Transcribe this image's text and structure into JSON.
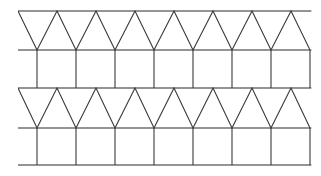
{
  "figure": {
    "background_color": "#ffffff",
    "line_color": "#2b2b2b",
    "zigzag_color": "#3a3a3a",
    "width": 321,
    "height": 176,
    "stroke_width": 1.1
  },
  "geometry": {
    "margin_left": 18,
    "margin_right": 311,
    "horizontal_lines_y": [
      11,
      50,
      88,
      128,
      165
    ],
    "band_count": 4,
    "bands": [
      {
        "index": 0,
        "type": "zigzag",
        "label": "triangle-band-top",
        "top_y": 11,
        "bottom_y": 50,
        "period": 39,
        "phase_offset": 0,
        "apex_count": 7,
        "apex_x": [
          57,
          96,
          135,
          174,
          213,
          252,
          291
        ],
        "valley_x": [
          37,
          76,
          115,
          154,
          193,
          232,
          271,
          310
        ]
      },
      {
        "index": 1,
        "type": "square",
        "label": "square-band-upper",
        "top_y": 50,
        "bottom_y": 88,
        "period": 39,
        "phase_offset": 0,
        "rib_count": 8,
        "rib_x": [
          37,
          76,
          115,
          154,
          193,
          232,
          271,
          310
        ]
      },
      {
        "index": 2,
        "type": "zigzag",
        "label": "triangle-band-lower",
        "top_y": 88,
        "bottom_y": 128,
        "period": 39,
        "phase_offset": 0,
        "apex_count": 7,
        "apex_x": [
          57,
          96,
          135,
          174,
          213,
          252,
          291
        ],
        "valley_x": [
          37,
          76,
          115,
          154,
          193,
          232,
          271,
          310
        ]
      },
      {
        "index": 3,
        "type": "square",
        "label": "square-band-lower",
        "top_y": 128,
        "bottom_y": 165,
        "period": 39,
        "phase_offset": 0,
        "rib_count": 8,
        "rib_x": [
          37,
          76,
          115,
          154,
          193,
          232,
          271,
          310
        ]
      }
    ]
  }
}
